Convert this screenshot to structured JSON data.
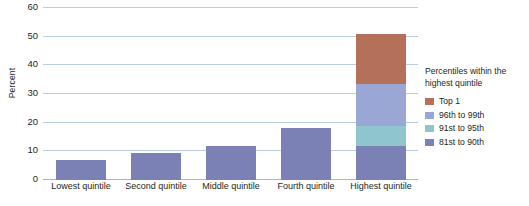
{
  "chart_data": {
    "type": "bar",
    "title": "",
    "xlabel": "",
    "ylabel": "Percent",
    "ylim": [
      0,
      60
    ],
    "yticks": [
      0,
      10,
      20,
      30,
      40,
      50,
      60
    ],
    "grid": true,
    "stacked_last_category": true,
    "legend_position": "right",
    "legend_title": "Percentiles within the highest quintile",
    "categories": [
      "Lowest quintile",
      "Second quintile",
      "Middle quintile",
      "Fourth quintile",
      "Highest quintile"
    ],
    "values": [
      7,
      9.5,
      12,
      18,
      51
    ],
    "series": [
      {
        "name": "81st to 90th",
        "values": [
          7,
          9.5,
          12,
          18,
          12
        ],
        "color": "#7b80b5"
      },
      {
        "name": "91st to 95th",
        "values": [
          0,
          0,
          0,
          0,
          7
        ],
        "color": "#8fc6cd"
      },
      {
        "name": "96th to 99th",
        "values": [
          0,
          0,
          0,
          0,
          14.5
        ],
        "color": "#9aa6d4"
      },
      {
        "name": "Top 1",
        "values": [
          0,
          0,
          0,
          0,
          17.5
        ],
        "color": "#b5705a"
      }
    ],
    "legend_entries": [
      {
        "label": "Top 1",
        "color": "#b5705a"
      },
      {
        "label": "96th to 99th",
        "color": "#9aa6d4"
      },
      {
        "label": "91st to 95th",
        "color": "#8fc6cd"
      },
      {
        "label": "81st to 90th",
        "color": "#7b80b5"
      }
    ],
    "colors": {
      "gridline": "#b8cce4",
      "axis": "#9bb7d9",
      "bar_default": "#7b80b5"
    }
  }
}
